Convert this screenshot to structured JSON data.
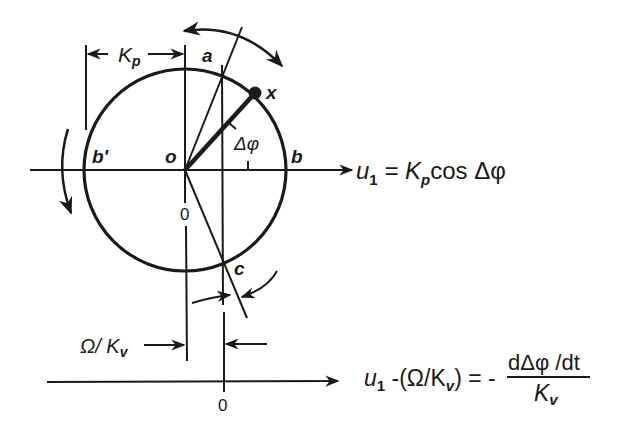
{
  "labels": {
    "kp": "K",
    "kp_sub": "p",
    "a": "a",
    "x": "x",
    "o": "o",
    "b": "b",
    "b_prime": "b'",
    "c": "c",
    "delta_phi": "Δφ",
    "zero_upper": "0",
    "zero_lower": "0",
    "omega_kv": "Ω/ K",
    "omega_kv_sub": "v"
  },
  "equations": {
    "eq1_u": "u",
    "eq1_u_sub": "1",
    "eq1_rhs": " = K",
    "eq1_kp_sub": "p",
    "eq1_tail": "cos Δφ",
    "eq2_u": "u",
    "eq2_u_sub": "1",
    "eq2_mid": " -(Ω/K",
    "eq2_kv_sub": "v",
    "eq2_close": ") = -",
    "eq2_num": "dΔφ /dt",
    "eq2_den": "K",
    "eq2_den_sub": "v"
  },
  "colors": {
    "ink": "#1a1a1a",
    "background": "#ffffff"
  }
}
